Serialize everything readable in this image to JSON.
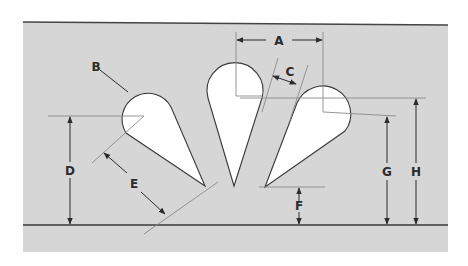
{
  "diagram": {
    "type": "technical dimension drawing",
    "colors": {
      "panel": "#d6d6d6",
      "shape_fill": "#ffffff",
      "line": "#3a3a3a",
      "extension_line": "#8a8a8a",
      "text": "#2b2b2b"
    },
    "labels": {
      "A": "A",
      "B": "B",
      "C": "C",
      "D": "D",
      "E": "E",
      "F": "F",
      "G": "G",
      "H": "H"
    },
    "dimensions": [
      {
        "id": "A",
        "meaning": "center-to-center horizontal spacing between middle and right teardrop"
      },
      {
        "id": "B",
        "meaning": "leader to rounded head of left teardrop"
      },
      {
        "id": "C",
        "meaning": "web width between middle and right teardrop"
      },
      {
        "id": "D",
        "meaning": "height from baseline to left teardrop center"
      },
      {
        "id": "E",
        "meaning": "length of left teardrop along its axis"
      },
      {
        "id": "F",
        "meaning": "height from baseline to right teardrop tip"
      },
      {
        "id": "G",
        "meaning": "height from baseline to right teardrop center"
      },
      {
        "id": "H",
        "meaning": "height from baseline to top of middle/right reference line"
      }
    ]
  }
}
